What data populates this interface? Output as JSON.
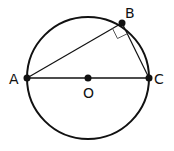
{
  "diagram": {
    "type": "geometry",
    "circle": {
      "center": "O",
      "cx": 88,
      "cy": 78,
      "r": 61
    },
    "points": {
      "A": {
        "label": "A",
        "x": 27,
        "y": 78
      },
      "B": {
        "label": "B",
        "x": 122,
        "y": 23
      },
      "C": {
        "label": "C",
        "x": 149,
        "y": 78
      },
      "O": {
        "label": "O",
        "x": 88,
        "y": 78
      }
    },
    "segments": [
      "AB",
      "BC",
      "AC"
    ],
    "right_angle_at": "B",
    "stroke_color": "#111111"
  }
}
